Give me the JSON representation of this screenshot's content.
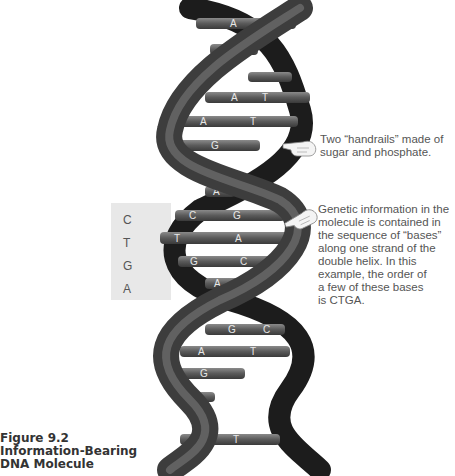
{
  "figure": {
    "number": "Figure 9.2",
    "title_line1": "Information-Bearing",
    "title_line2": "DNA Molecule"
  },
  "annotations": {
    "handrails": {
      "line1": "Two “handrails” made of",
      "line2": "sugar and phosphate."
    },
    "genetic_info": {
      "lines": [
        "Genetic information in the",
        "molecule is contained in",
        "the sequence of “bases”",
        "along one strand of the",
        "double helix. In this",
        "example, the order of",
        "a few of these bases",
        "is CTGA."
      ]
    }
  },
  "sequence_box": {
    "letters": [
      "C",
      "T",
      "G",
      "A"
    ]
  },
  "base_pairs": [
    {
      "left": "A",
      "right": "G",
      "y": 24
    },
    {
      "left": "G",
      "right": "",
      "y": 50
    },
    {
      "left": "",
      "right": "",
      "y": 78
    },
    {
      "left": "A",
      "right": "T",
      "y": 98
    },
    {
      "left": "A",
      "right": "T",
      "y": 122
    },
    {
      "left": "C",
      "right": "G",
      "y": 146
    },
    {
      "left": "",
      "right": "",
      "y": 170
    },
    {
      "left": "A",
      "right": "",
      "y": 192
    },
    {
      "left": "C",
      "right": "G",
      "y": 216
    },
    {
      "left": "T",
      "right": "A",
      "y": 238
    },
    {
      "left": "G",
      "right": "C",
      "y": 262
    },
    {
      "left": "A",
      "right": "",
      "y": 283
    },
    {
      "left": "G",
      "right": "C",
      "y": 330
    },
    {
      "left": "A",
      "right": "T",
      "y": 352
    },
    {
      "left": "C",
      "right": "G",
      "y": 374
    },
    {
      "left": "",
      "right": "",
      "y": 396
    },
    {
      "left": "A",
      "right": "T",
      "y": 440
    }
  ],
  "icons": {
    "pointer_hand_1": "pointing-hand",
    "pointer_hand_2": "pointing-hand"
  }
}
